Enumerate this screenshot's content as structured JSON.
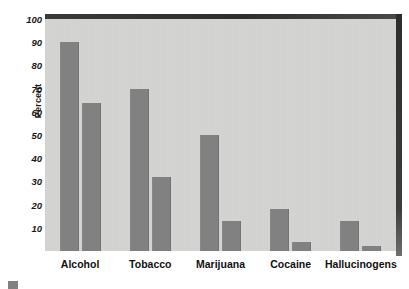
{
  "chart_data": {
    "type": "bar",
    "title": "",
    "subtitle": "",
    "xlabel": "",
    "ylabel": "Percent",
    "categories": [
      "Alcohol",
      "Tobacco",
      "Marijuana",
      "Cocaine",
      "Hallucinogens"
    ],
    "series": [
      {
        "name": "Ever used",
        "values": [
          90,
          70,
          50,
          18,
          13
        ]
      },
      {
        "name": "Used in past year",
        "values": [
          64,
          32,
          13,
          4,
          2
        ]
      }
    ],
    "ylim": [
      0,
      100
    ],
    "yticks": [
      100,
      90,
      80,
      70,
      60,
      50,
      40,
      30,
      20,
      10
    ],
    "ytick_labels": [
      "100",
      "90",
      "80",
      "70",
      "60",
      "50",
      "40",
      "30",
      "20",
      "10"
    ],
    "grid": false,
    "legend_position": "below-left",
    "legend_visible_partially": true,
    "bar_color": "#818181",
    "plot_background": "#d4d4d2",
    "page_background": "#ffffff",
    "axis_text_color": "#1a1a1a"
  },
  "legend": {
    "items": [
      {
        "label": "",
        "color": "#818181"
      }
    ]
  }
}
